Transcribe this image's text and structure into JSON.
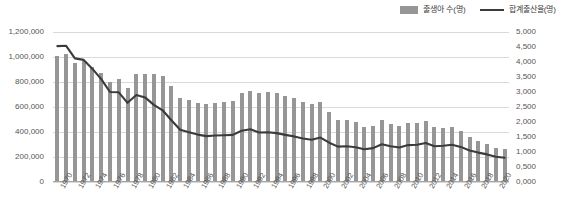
{
  "legend": {
    "items": [
      {
        "label": "출생아 수(명)",
        "marker": "bar-swatch-icon",
        "color": "#969696"
      },
      {
        "label": "합계출산율(명)",
        "marker": "line-swatch-icon",
        "color": "#3b3b3b"
      }
    ]
  },
  "axes": {
    "left": {
      "ticks": [
        "1,200,000",
        "1,000,000",
        "800,000",
        "600,000",
        "400,000",
        "200,000",
        "0"
      ],
      "min": 0,
      "max": 1200000
    },
    "right": {
      "ticks": [
        "5,000",
        "4,500",
        "4,000",
        "3,500",
        "3,000",
        "2,500",
        "2,000",
        "1,500",
        "1,000",
        "0,500",
        "0,000"
      ],
      "min": 0,
      "max": 5
    },
    "x": {
      "labels": [
        "1970",
        "1972",
        "1974",
        "1976",
        "1978",
        "1980",
        "1982",
        "1984",
        "1986",
        "1988",
        "1990",
        "1992",
        "1994",
        "1996",
        "1998",
        "2000",
        "2002",
        "2004",
        "2006",
        "2008",
        "2010",
        "2012",
        "2014",
        "2016",
        "2018",
        "2020"
      ]
    }
  },
  "chart_data": {
    "type": "bar",
    "title": "",
    "subtitle": "",
    "xlabel": "",
    "ylabel": "",
    "grid": true,
    "legend_position": "top-right",
    "categories": [
      1970,
      1971,
      1972,
      1973,
      1974,
      1975,
      1976,
      1977,
      1978,
      1979,
      1980,
      1981,
      1982,
      1983,
      1984,
      1985,
      1986,
      1987,
      1988,
      1989,
      1990,
      1991,
      1992,
      1993,
      1994,
      1995,
      1996,
      1997,
      1998,
      1999,
      2000,
      2001,
      2002,
      2003,
      2004,
      2005,
      2006,
      2007,
      2008,
      2009,
      2010,
      2011,
      2012,
      2013,
      2014,
      2015,
      2016,
      2017,
      2018,
      2019,
      2020,
      2021
    ],
    "series": [
      {
        "name": "출생아 수(명)",
        "type": "bar",
        "axis": "left",
        "color": "#969696",
        "values": [
          1006645,
          1024773,
          952780,
          965521,
          922823,
          874030,
          796331,
          825339,
          750728,
          862669,
          862835,
          867409,
          848312,
          769155,
          674793,
          655489,
          636019,
          623831,
          633092,
          639431,
          649738,
          709275,
          730678,
          715826,
          721185,
          715020,
          691226,
          675394,
          641594,
          620668,
          640089,
          559934,
          496911,
          495036,
          476958,
          438707,
          451759,
          496822,
          465892,
          444849,
          470171,
          471265,
          484550,
          436455,
          435435,
          438420,
          406243,
          357771,
          326822,
          302676,
          272337,
          260562
        ]
      },
      {
        "name": "합계출산율(명)",
        "type": "line",
        "axis": "right",
        "color": "#3b3b3b",
        "values": [
          4.53,
          4.54,
          4.12,
          4.07,
          3.77,
          3.43,
          3.0,
          2.99,
          2.64,
          2.9,
          2.82,
          2.57,
          2.39,
          2.06,
          1.74,
          1.66,
          1.58,
          1.53,
          1.55,
          1.56,
          1.57,
          1.71,
          1.76,
          1.65,
          1.66,
          1.63,
          1.57,
          1.52,
          1.45,
          1.41,
          1.48,
          1.31,
          1.18,
          1.19,
          1.16,
          1.09,
          1.13,
          1.26,
          1.19,
          1.15,
          1.23,
          1.24,
          1.3,
          1.19,
          1.21,
          1.24,
          1.17,
          1.05,
          0.98,
          0.92,
          0.84,
          0.81
        ]
      }
    ]
  }
}
